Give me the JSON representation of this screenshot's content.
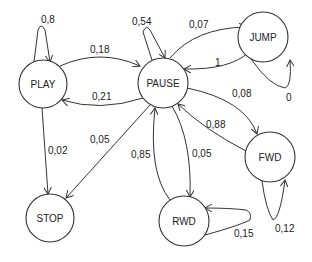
{
  "diagram": {
    "type": "state-transition",
    "nodes": [
      {
        "id": "play",
        "label": "PLAY",
        "cx": 43,
        "cy": 84,
        "r": 24
      },
      {
        "id": "pause",
        "label": "PAUSE",
        "cx": 163,
        "cy": 83,
        "r": 25
      },
      {
        "id": "jump",
        "label": "JUMP",
        "cx": 263,
        "cy": 37,
        "r": 25
      },
      {
        "id": "fwd",
        "label": "FWD",
        "cx": 270,
        "cy": 157,
        "r": 25
      },
      {
        "id": "stop",
        "label": "STOP",
        "cx": 50,
        "cy": 218,
        "r": 24
      },
      {
        "id": "rwd",
        "label": "RWD",
        "cx": 184,
        "cy": 221,
        "r": 25
      }
    ],
    "edges": [
      {
        "from": "PLAY",
        "to": "PLAY",
        "label": "0,8"
      },
      {
        "from": "PLAY",
        "to": "PAUSE",
        "label": "0,18"
      },
      {
        "from": "PAUSE",
        "to": "PLAY",
        "label": "0,21"
      },
      {
        "from": "PLAY",
        "to": "STOP",
        "label": "0,02"
      },
      {
        "from": "PAUSE",
        "to": "PAUSE",
        "label": "0,54"
      },
      {
        "from": "PAUSE",
        "to": "JUMP",
        "label": "0,07"
      },
      {
        "from": "JUMP",
        "to": "PAUSE",
        "label": "1"
      },
      {
        "from": "JUMP",
        "to": "JUMP",
        "label": "0"
      },
      {
        "from": "PAUSE",
        "to": "FWD",
        "label": "0,08"
      },
      {
        "from": "FWD",
        "to": "PAUSE",
        "label": "0,88"
      },
      {
        "from": "FWD",
        "to": "FWD",
        "label": "0,12"
      },
      {
        "from": "PAUSE",
        "to": "STOP",
        "label": "0,05"
      },
      {
        "from": "RWD",
        "to": "PAUSE",
        "label": "0,85"
      },
      {
        "from": "PAUSE",
        "to": "RWD",
        "label": "0,05"
      },
      {
        "from": "RWD",
        "to": "RWD",
        "label": "0,15"
      }
    ]
  }
}
